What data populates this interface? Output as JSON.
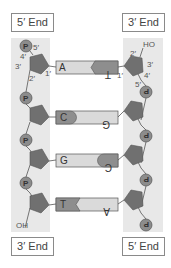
{
  "ends": {
    "top_left": "5′ End",
    "top_right": "3′ End",
    "bottom_left": "3′ End",
    "bottom_right": "5′ End"
  },
  "left_strand": {
    "phosphate_label": "P",
    "terminal_label": "OH",
    "carbon_labels": {
      "c5": "5′",
      "c4": "4′",
      "c3": "3′",
      "c2": "2′",
      "c1": "1′"
    }
  },
  "right_strand": {
    "phosphate_label": "P",
    "terminal_label": "HO",
    "carbon_labels": {
      "c5": "5′",
      "c4": "4′",
      "c3": "3′",
      "c2": "2′",
      "c1": "1′"
    }
  },
  "base_pairs": [
    {
      "left": "A",
      "right": "T",
      "left_shade": "light",
      "right_shade": "dark"
    },
    {
      "left": "C",
      "right": "G",
      "left_shade": "dark",
      "right_shade": "light"
    },
    {
      "left": "G",
      "right": "C",
      "left_shade": "light",
      "right_shade": "dark"
    },
    {
      "left": "T",
      "right": "A",
      "left_shade": "dark",
      "right_shade": "light"
    }
  ],
  "colors": {
    "band": "#e8e8e8",
    "sugar": "#707070",
    "phosphate": "#8c8c8c",
    "base_light": "#dadada",
    "base_dark": "#8e8e8e",
    "outline": "#555555"
  }
}
